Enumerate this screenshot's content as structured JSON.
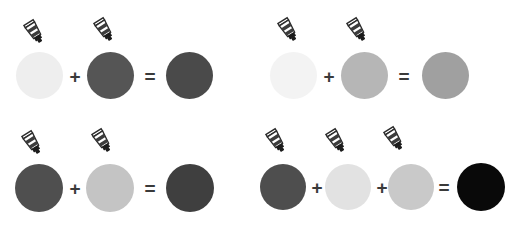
{
  "page": {
    "title": "Paint Color Mixing Chart",
    "background_color": "#ffffff",
    "width": 504,
    "height": 226,
    "layout": "2x2 grid of paint mixing equations"
  },
  "symbols": {
    "plus": "+",
    "equals": "=",
    "operator_color": "#3a3a3a"
  },
  "icons": {
    "paint_tube": {
      "name": "paint-tube-icon",
      "body_color": "#ffffff",
      "band_color": "#3c3c3c",
      "outline_color": "#2b2b2b",
      "nozzle_color": "#1c1c1c",
      "rotation_degrees": -32
    }
  },
  "equations": [
    {
      "id": "equation-top-left",
      "position": {
        "x": 0,
        "y": 0
      },
      "operands": [
        {
          "label": "very light gray paint",
          "color": "#eeeeee",
          "has_tube": true
        },
        {
          "label": "dark gray paint",
          "color": "#555555",
          "has_tube": true
        }
      ],
      "result": {
        "label": "darker gray paint",
        "color": "#4a4a4a"
      }
    },
    {
      "id": "equation-top-right",
      "position": {
        "x": 252,
        "y": 0
      },
      "operands": [
        {
          "label": "near white paint",
          "color": "#f3f3f3",
          "has_tube": true
        },
        {
          "label": "light medium gray paint",
          "color": "#b6b6b6",
          "has_tube": true
        }
      ],
      "result": {
        "label": "medium gray paint",
        "color": "#a0a0a0"
      }
    },
    {
      "id": "equation-bottom-left",
      "position": {
        "x": 0,
        "y": 113
      },
      "operands": [
        {
          "label": "dark gray paint",
          "color": "#4f4f4f",
          "has_tube": true
        },
        {
          "label": "light gray paint",
          "color": "#c4c4c4",
          "has_tube": true
        }
      ],
      "result": {
        "label": "dark gray paint",
        "color": "#3f3f3f"
      }
    },
    {
      "id": "equation-bottom-right",
      "position": {
        "x": 252,
        "y": 113
      },
      "operands": [
        {
          "label": "dark gray paint",
          "color": "#4e4e4e",
          "has_tube": true
        },
        {
          "label": "very light gray paint",
          "color": "#e2e2e2",
          "has_tube": true
        },
        {
          "label": "light gray paint",
          "color": "#c9c9c9",
          "has_tube": true
        }
      ],
      "result": {
        "label": "black paint",
        "color": "#090909"
      }
    }
  ]
}
